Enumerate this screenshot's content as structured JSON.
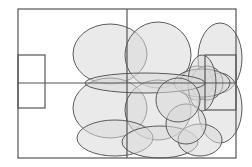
{
  "diagram": {
    "type": "soccer-pitch-zone-overlay",
    "colors": {
      "background": "#ffffff",
      "line": "#555555",
      "zone_fill": "#d9d9d9",
      "zone_fill_opacity": 0.55,
      "zone_stroke": "#5a5a5a"
    },
    "pitch": {
      "x": 18,
      "y": 9,
      "width": 218,
      "height": 149,
      "midline_x": 127,
      "center_line_y": 83,
      "left_box": {
        "x": 18,
        "y": 55,
        "width": 27,
        "height": 53
      },
      "right_box": {
        "x": 205,
        "y": 55,
        "width": 31,
        "height": 55
      }
    },
    "zones": [
      {
        "cx": 110,
        "cy": 54,
        "rx": 37,
        "ry": 30
      },
      {
        "cx": 158,
        "cy": 55,
        "rx": 33,
        "ry": 33
      },
      {
        "cx": 220,
        "cy": 58,
        "rx": 22,
        "ry": 35
      },
      {
        "cx": 110,
        "cy": 108,
        "rx": 37,
        "ry": 30
      },
      {
        "cx": 158,
        "cy": 110,
        "rx": 33,
        "ry": 30
      },
      {
        "cx": 220,
        "cy": 108,
        "rx": 22,
        "ry": 35
      },
      {
        "cx": 197,
        "cy": 83,
        "rx": 16,
        "ry": 17
      },
      {
        "cx": 207,
        "cy": 83,
        "rx": 16,
        "ry": 17
      },
      {
        "cx": 202,
        "cy": 83,
        "rx": 28,
        "ry": 14
      },
      {
        "cx": 202,
        "cy": 83,
        "rx": 14,
        "ry": 28
      },
      {
        "cx": 145,
        "cy": 83,
        "rx": 60,
        "ry": 10
      },
      {
        "cx": 115,
        "cy": 138,
        "rx": 38,
        "ry": 18
      },
      {
        "cx": 160,
        "cy": 142,
        "rx": 38,
        "ry": 16
      },
      {
        "cx": 200,
        "cy": 140,
        "rx": 22,
        "ry": 16
      },
      {
        "cx": 186,
        "cy": 124,
        "rx": 20,
        "ry": 20
      },
      {
        "cx": 178,
        "cy": 100,
        "rx": 22,
        "ry": 22
      }
    ]
  }
}
